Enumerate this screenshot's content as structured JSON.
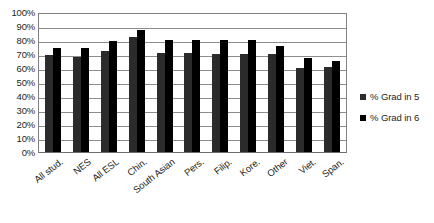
{
  "chart_data": {
    "type": "bar",
    "title": "",
    "xlabel": "",
    "ylabel": "",
    "ylim": [
      0,
      100
    ],
    "ytick_labels": [
      "100%",
      "90%",
      "80%",
      "70%",
      "60%",
      "50%",
      "40%",
      "30%",
      "20%",
      "10%",
      "0%"
    ],
    "ytick_values": [
      100,
      90,
      80,
      70,
      60,
      50,
      40,
      30,
      20,
      10,
      0
    ],
    "grid": true,
    "legend_position": "right",
    "categories": [
      "All stud.",
      "NES",
      "All ESL",
      "Chin.",
      "South Asian",
      "Pers.",
      "Filip.",
      "Kore.",
      "Other",
      "Viet.",
      "Span."
    ],
    "series": [
      {
        "name": "% Grad in 5",
        "color": "#2b2b2b",
        "values": [
          69,
          68,
          72,
          82,
          71,
          71,
          70,
          70,
          70,
          60,
          61
        ]
      },
      {
        "name": "% Grad in 6",
        "color": "#000000",
        "values": [
          74,
          74,
          79,
          87,
          80,
          80,
          80,
          80,
          76,
          67,
          65
        ]
      }
    ]
  }
}
